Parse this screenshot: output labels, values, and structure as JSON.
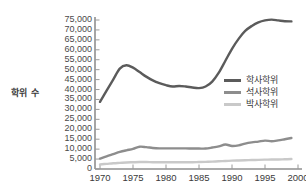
{
  "chart_data": {
    "type": "line",
    "title": "",
    "xlabel": "",
    "ylabel": "학위 수",
    "xlim": [
      1970,
      2000
    ],
    "ylim": [
      0,
      75000
    ],
    "grid": false,
    "legend_position": "right-middle",
    "x_ticks": [
      "1970",
      "1975",
      "1980",
      "1985",
      "1990",
      "1995",
      "2000"
    ],
    "x_tick_values": [
      1970,
      1975,
      1980,
      1985,
      1990,
      1995,
      2000
    ],
    "y_ticks": [
      "0",
      "5,000",
      "10,000",
      "15,000",
      "20,000",
      "25,000",
      "30,000",
      "35,000",
      "40,000",
      "45,000",
      "50,000",
      "55,000",
      "60,000",
      "65,000",
      "70,000",
      "75,000"
    ],
    "y_tick_values": [
      0,
      5000,
      10000,
      15000,
      20000,
      25000,
      30000,
      35000,
      40000,
      45000,
      50000,
      55000,
      60000,
      65000,
      70000,
      75000
    ],
    "x": [
      1970,
      1971,
      1972,
      1973,
      1974,
      1975,
      1976,
      1977,
      1978,
      1979,
      1980,
      1981,
      1982,
      1983,
      1984,
      1985,
      1986,
      1987,
      1988,
      1989,
      1990,
      1991,
      1992,
      1993,
      1994,
      1995,
      1996,
      1997,
      1998,
      1999
    ],
    "series": [
      {
        "name": "학사학위",
        "color": "#5b5b5b",
        "values": [
          33800,
          39500,
          45000,
          50500,
          52200,
          51000,
          48800,
          46500,
          44600,
          43200,
          42200,
          41500,
          41800,
          41500,
          41000,
          40700,
          41500,
          44000,
          48500,
          54500,
          60500,
          65500,
          69500,
          72000,
          73800,
          74800,
          75200,
          74800,
          74400,
          74300
        ]
      },
      {
        "name": "석사학위",
        "color": "#8d8d8d",
        "values": [
          5200,
          6400,
          7500,
          8600,
          9400,
          10100,
          11200,
          11000,
          10600,
          10400,
          10400,
          10400,
          10400,
          10400,
          10300,
          10300,
          10300,
          10800,
          11400,
          12300,
          11600,
          11900,
          12800,
          13400,
          13800,
          14300,
          14000,
          14400,
          15000,
          15600
        ]
      },
      {
        "name": "박사학위",
        "color": "#c9c9c9",
        "values": [
          2300,
          2600,
          2900,
          3100,
          3300,
          3400,
          3500,
          3500,
          3400,
          3400,
          3400,
          3400,
          3400,
          3400,
          3400,
          3500,
          3600,
          3700,
          3900,
          4000,
          4200,
          4300,
          4400,
          4500,
          4600,
          4700,
          4800,
          4800,
          4900,
          5000
        ]
      }
    ]
  },
  "axis": {
    "y_title": "학위 수"
  },
  "legend": {
    "items": [
      {
        "label": "학사학위",
        "color": "#5b5b5b"
      },
      {
        "label": "석사학위",
        "color": "#8d8d8d"
      },
      {
        "label": "박사학위",
        "color": "#c9c9c9"
      }
    ]
  }
}
